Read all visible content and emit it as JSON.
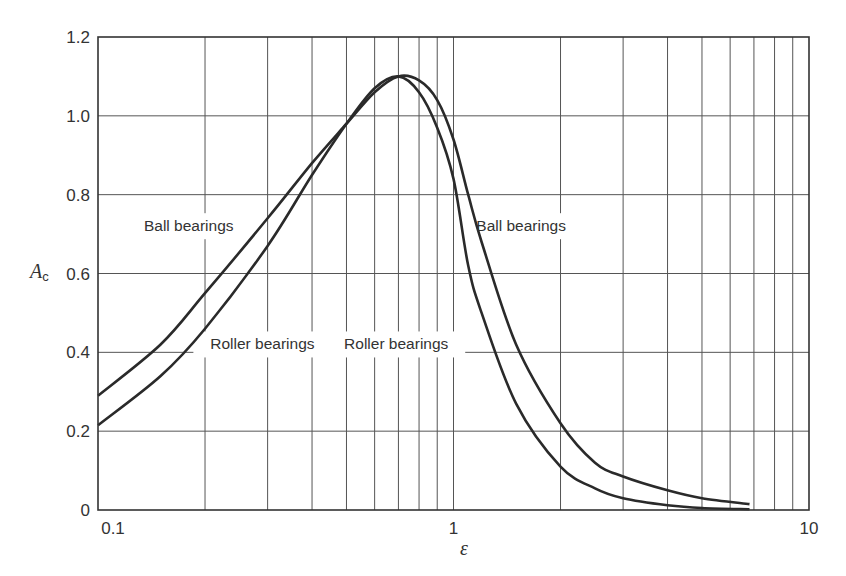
{
  "chart_data": {
    "type": "line",
    "title": "",
    "xlabel": "ε",
    "ylabel": "A_c",
    "ylabel_main": "A",
    "ylabel_sub": "c",
    "xscale": "log",
    "xlim": [
      0.1,
      10
    ],
    "ylim": [
      0,
      1.2
    ],
    "grid": true,
    "x_ticks": [
      0.1,
      1,
      10
    ],
    "x_tick_labels": [
      "0.1",
      "1",
      "10"
    ],
    "y_ticks": [
      0,
      0.2,
      0.4,
      0.6,
      0.8,
      1.0,
      1.2
    ],
    "y_tick_labels": [
      "0",
      "0.2",
      "0.4",
      "0.6",
      "0.8",
      "1.0",
      "1.2"
    ],
    "series": [
      {
        "name": "Ball bearings",
        "x": [
          0.1,
          0.15,
          0.2,
          0.3,
          0.4,
          0.5,
          0.6,
          0.7,
          0.8,
          0.9,
          1.0,
          1.1,
          1.2,
          1.5,
          2.0,
          2.5,
          3.0,
          4.0,
          5.0,
          6.8
        ],
        "values": [
          0.29,
          0.42,
          0.55,
          0.74,
          0.88,
          0.98,
          1.06,
          1.1,
          1.09,
          1.04,
          0.94,
          0.8,
          0.68,
          0.42,
          0.22,
          0.12,
          0.085,
          0.05,
          0.03,
          0.015
        ]
      },
      {
        "name": "Roller bearings",
        "x": [
          0.1,
          0.15,
          0.2,
          0.3,
          0.4,
          0.5,
          0.6,
          0.7,
          0.8,
          0.9,
          1.0,
          1.1,
          1.2,
          1.5,
          2.0,
          2.5,
          3.0,
          4.0,
          5.0,
          6.8
        ],
        "values": [
          0.215,
          0.34,
          0.46,
          0.67,
          0.85,
          0.98,
          1.07,
          1.1,
          1.06,
          0.97,
          0.84,
          0.62,
          0.5,
          0.27,
          0.11,
          0.055,
          0.03,
          0.012,
          0.005,
          0.002
        ]
      }
    ],
    "annotations": [
      {
        "text": "Ball bearings",
        "x": 0.18,
        "y": 0.72,
        "series": "Ball bearings"
      },
      {
        "text": "Roller bearings",
        "x": 0.29,
        "y": 0.42,
        "series": "Roller bearings"
      },
      {
        "text": "Ball bearings",
        "x": 1.55,
        "y": 0.72,
        "series": "Ball bearings"
      },
      {
        "text": "Roller bearings",
        "x": 0.69,
        "y": 0.42,
        "series": "Roller bearings"
      }
    ]
  }
}
